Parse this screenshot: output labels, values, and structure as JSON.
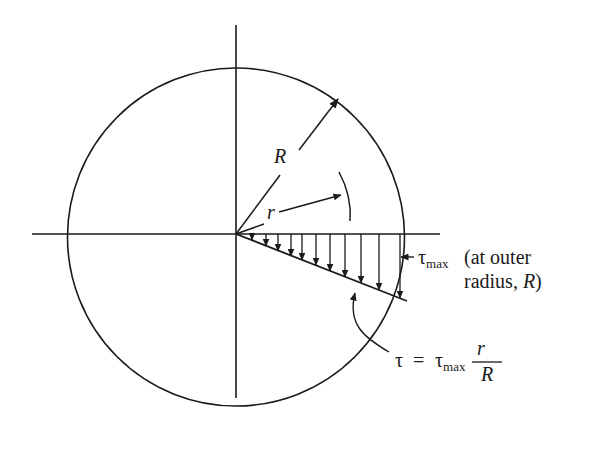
{
  "diagram": {
    "type": "shear-stress-distribution",
    "colors": {
      "ink": "#1a1a1a",
      "background": "#ffffff"
    },
    "labels": {
      "outer_radius": "R",
      "radius": "r",
      "tau_max_symbol": "τ",
      "tau_max_sub": "max",
      "tau_max_note_line1": "(at outer",
      "tau_max_note_line2_prefix": "radius, ",
      "tau_max_note_line2_var": "R",
      "tau_max_note_line2_suffix": ")",
      "formula_lhs": "τ",
      "formula_eq": "=",
      "formula_tau": "τ",
      "formula_sub": "max",
      "formula_num": "r",
      "formula_den": "R"
    },
    "geometry": {
      "center": [
        236,
        234
      ],
      "circle_rx": 168.5,
      "circle_ry": 169,
      "horizontal_axis": [
        32,
        440
      ],
      "vertical_axis": [
        25,
        398
      ],
      "stress_arrow_x": [
        252,
        266,
        278,
        291,
        302,
        316,
        330,
        345,
        361,
        379,
        400
      ]
    }
  }
}
